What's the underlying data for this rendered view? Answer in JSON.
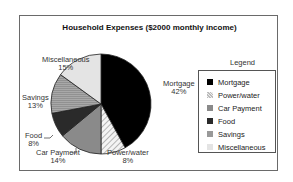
{
  "chart_data": {
    "type": "pie",
    "title": "Household Expenses ($2000 monthly income)",
    "categories": [
      "Mortgage",
      "Power/water",
      "Car Payment",
      "Food",
      "Savings",
      "Miscellaneous"
    ],
    "values": [
      42,
      8,
      14,
      8,
      13,
      15
    ],
    "unit": "%",
    "colors": [
      "#000000",
      "#d8d8d8",
      "#8a8a8a",
      "#2a2a2a",
      "#a0a0a0",
      "#e4e4e4"
    ],
    "patterns": [
      "solid",
      "diagonal-hatch",
      "solid",
      "solid",
      "horizontal-lines",
      "solid"
    ],
    "start_angle_deg": 0,
    "direction": "clockwise",
    "legend": {
      "title": "Legend",
      "position": "right",
      "entries": [
        "Mortgage",
        "Power/water",
        "Car Payment",
        "Food",
        "Savings",
        "Miscellaneous"
      ]
    }
  },
  "labels": {
    "title": "Household Expenses ($2000 monthly income)",
    "legend_title": "Legend",
    "slices": [
      {
        "name": "Mortgage",
        "pct": "42%"
      },
      {
        "name": "Power/water",
        "pct": "8%"
      },
      {
        "name": "Car Payment",
        "pct": "14%"
      },
      {
        "name": "Food",
        "pct": "8%"
      },
      {
        "name": "Savings",
        "pct": "13%"
      },
      {
        "name": "Miscellaneous",
        "pct": "15%"
      }
    ]
  }
}
